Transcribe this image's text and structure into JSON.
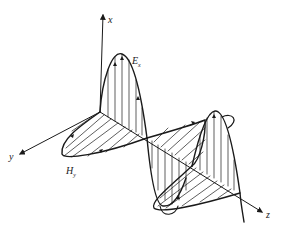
{
  "figure": {
    "axes": {
      "x_label": "x",
      "y_label": "y",
      "z_label": "z"
    },
    "fields": {
      "e_label": "E",
      "e_subscript": "x",
      "h_label": "H",
      "h_subscript": "y"
    },
    "colors": {
      "ink": "#1a1a1a",
      "background": "#ffffff"
    }
  }
}
